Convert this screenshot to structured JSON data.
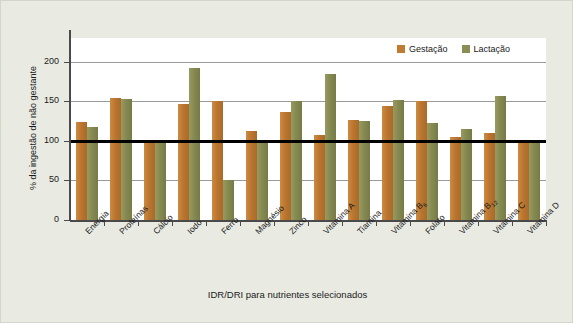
{
  "chart_data": {
    "type": "bar",
    "title": "",
    "xlabel": "IDR/DRI para nutrientes selecionados",
    "ylabel": "% da ingestão de não gestante",
    "ylim": [
      0,
      230
    ],
    "yticks": [
      0,
      50,
      100,
      150,
      200
    ],
    "ytick_labels": [
      "0",
      "50",
      "100",
      "150",
      "200"
    ],
    "grid": true,
    "gridlines_at": [
      50,
      100,
      150,
      200
    ],
    "reference_line": {
      "value": 100,
      "color": "#000000",
      "width": 3
    },
    "legend_position": "top-right",
    "categories": [
      "Energia",
      "Proteínas",
      "Cálcio",
      "Iodo",
      "Ferro",
      "Magnésio",
      "Zinco",
      "Vitamina A",
      "Tiamina",
      "Vitamina B6",
      "Folato",
      "Vitamina B12",
      "Vitamina C",
      "Vitamina D"
    ],
    "category_labels_html": [
      "Energia",
      "Proteínas",
      "Cálcio",
      "Iodo",
      "Ferro",
      "Magnésio",
      "Zinco",
      "Vitamina A",
      "Tiamina",
      "Vitamina B<sub>6</sub>",
      "Folato",
      "Vitamina B<sub>12</sub>",
      "Vitamina C",
      "Vitamina D"
    ],
    "series": [
      {
        "name": "Gestação",
        "color": "#bf7b33",
        "values": [
          124,
          154,
          100,
          147,
          150,
          113,
          137,
          108,
          127,
          144,
          150,
          105,
          110,
          100
        ]
      },
      {
        "name": "Lactação",
        "color": "#8a8e55",
        "values": [
          117,
          153,
          100,
          192,
          50,
          100,
          151,
          185,
          125,
          152,
          123,
          115,
          157,
          100
        ]
      }
    ]
  },
  "legend": {
    "items": [
      {
        "label": "Gestação",
        "color": "#bf7b33"
      },
      {
        "label": "Lactação",
        "color": "#8a8e55"
      }
    ]
  },
  "colors": {
    "figure_background": "#e9ebe3",
    "plot_background": "#ffffff",
    "axis": "#4a4a4a",
    "gridline": "#9a9a9a",
    "reference_line": "#000000",
    "gestacao": "#bf7b33",
    "lactacao": "#8a8e55",
    "text": "#1a1a1a"
  }
}
